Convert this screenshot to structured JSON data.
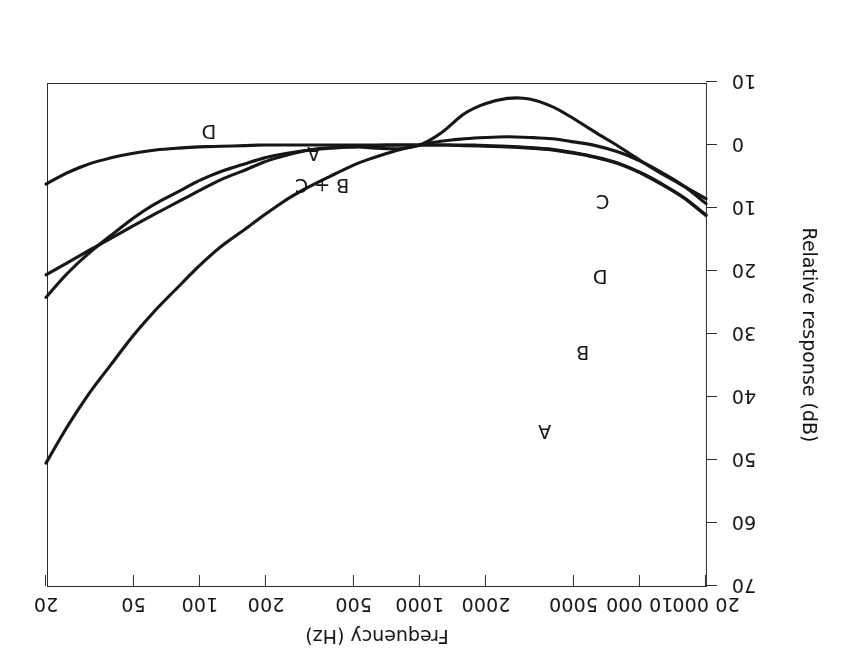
{
  "figure": {
    "orientation": "rotated-180",
    "background": "#ffffff",
    "ink_color": "#161616"
  },
  "chart_data": {
    "type": "line",
    "title": "",
    "xlabel": "Frequency (Hz)",
    "ylabel": "Relative response (dB)",
    "xscale": "log",
    "xlim": [
      20,
      20000
    ],
    "ylim": [
      -10,
      70
    ],
    "grid": false,
    "legend": "inline-curve-labels",
    "xticks": [
      20,
      50,
      100,
      200,
      500,
      1000,
      2000,
      5000,
      10000,
      20000
    ],
    "xtick_labels": [
      "20",
      "50",
      "100",
      "200",
      "500",
      "1000",
      "2000",
      "5000",
      "10 000",
      "20 000"
    ],
    "yticks": [
      70,
      60,
      50,
      40,
      30,
      20,
      10,
      0,
      -10
    ],
    "ytick_labels": [
      "70",
      "60",
      "50",
      "40",
      "30",
      "20",
      "10",
      "0",
      "10"
    ],
    "series": [
      {
        "name": "A",
        "label": "A",
        "points": [
          [
            20,
            50.5
          ],
          [
            25,
            44.7
          ],
          [
            31.5,
            39.4
          ],
          [
            40,
            34.6
          ],
          [
            50,
            30.2
          ],
          [
            63,
            26.2
          ],
          [
            80,
            22.5
          ],
          [
            100,
            19.1
          ],
          [
            125,
            16.1
          ],
          [
            160,
            13.4
          ],
          [
            200,
            10.9
          ],
          [
            250,
            8.6
          ],
          [
            315,
            6.6
          ],
          [
            400,
            4.8
          ],
          [
            500,
            3.2
          ],
          [
            630,
            1.9
          ],
          [
            800,
            0.8
          ],
          [
            1000,
            0.0
          ],
          [
            1250,
            -0.6
          ],
          [
            1600,
            -1.0
          ],
          [
            2000,
            -1.2
          ],
          [
            2500,
            -1.3
          ],
          [
            3150,
            -1.2
          ],
          [
            4000,
            -1.0
          ],
          [
            5000,
            -0.5
          ],
          [
            6300,
            0.1
          ],
          [
            8000,
            1.1
          ],
          [
            10000,
            2.5
          ],
          [
            12500,
            4.3
          ],
          [
            16000,
            6.6
          ],
          [
            20000,
            9.3
          ]
        ]
      },
      {
        "name": "B",
        "label": "B",
        "points": [
          [
            20,
            24.2
          ],
          [
            25,
            20.4
          ],
          [
            31.5,
            17.1
          ],
          [
            40,
            14.2
          ],
          [
            50,
            11.6
          ],
          [
            63,
            9.3
          ],
          [
            80,
            7.4
          ],
          [
            100,
            5.6
          ],
          [
            125,
            4.2
          ],
          [
            160,
            3.0
          ],
          [
            200,
            2.0
          ],
          [
            250,
            1.3
          ],
          [
            315,
            0.8
          ],
          [
            400,
            0.5
          ],
          [
            500,
            0.3
          ],
          [
            630,
            0.1
          ],
          [
            800,
            0.0
          ],
          [
            1000,
            0.0
          ],
          [
            1250,
            0.0
          ],
          [
            1600,
            0.0
          ],
          [
            2000,
            0.1
          ],
          [
            2500,
            0.2
          ],
          [
            3150,
            0.4
          ],
          [
            4000,
            0.7
          ],
          [
            5000,
            1.2
          ],
          [
            6300,
            1.9
          ],
          [
            8000,
            2.9
          ],
          [
            10000,
            4.3
          ],
          [
            12500,
            6.1
          ],
          [
            16000,
            8.4
          ],
          [
            20000,
            11.1
          ]
        ]
      },
      {
        "name": "C",
        "label": "C",
        "points": [
          [
            20,
            6.2
          ],
          [
            25,
            4.4
          ],
          [
            31.5,
            3.0
          ],
          [
            40,
            2.0
          ],
          [
            50,
            1.3
          ],
          [
            63,
            0.8
          ],
          [
            80,
            0.5
          ],
          [
            100,
            0.3
          ],
          [
            125,
            0.2
          ],
          [
            160,
            0.1
          ],
          [
            200,
            0.0
          ],
          [
            250,
            0.0
          ],
          [
            315,
            0.0
          ],
          [
            400,
            0.0
          ],
          [
            500,
            0.0
          ],
          [
            630,
            0.0
          ],
          [
            800,
            0.0
          ],
          [
            1000,
            0.0
          ],
          [
            1250,
            0.0
          ],
          [
            1600,
            0.1
          ],
          [
            2000,
            0.2
          ],
          [
            2500,
            0.3
          ],
          [
            3150,
            0.5
          ],
          [
            4000,
            0.8
          ],
          [
            5000,
            1.3
          ],
          [
            6300,
            2.0
          ],
          [
            8000,
            3.0
          ],
          [
            10000,
            4.4
          ],
          [
            12500,
            6.2
          ],
          [
            16000,
            8.5
          ],
          [
            20000,
            11.2
          ]
        ]
      },
      {
        "name": "D",
        "label": "D",
        "points": [
          [
            20,
            20.6
          ],
          [
            25,
            18.7
          ],
          [
            31.5,
            16.7
          ],
          [
            40,
            14.7
          ],
          [
            50,
            12.8
          ],
          [
            63,
            10.9
          ],
          [
            80,
            9.0
          ],
          [
            100,
            7.2
          ],
          [
            125,
            5.5
          ],
          [
            160,
            4.0
          ],
          [
            200,
            2.6
          ],
          [
            250,
            1.6
          ],
          [
            315,
            0.8
          ],
          [
            400,
            0.4
          ],
          [
            500,
            0.3
          ],
          [
            630,
            0.5
          ],
          [
            800,
            0.6
          ],
          [
            1000,
            0.0
          ],
          [
            1250,
            -1.9
          ],
          [
            1600,
            -5.0
          ],
          [
            2000,
            -6.6
          ],
          [
            2500,
            -7.4
          ],
          [
            3150,
            -7.3
          ],
          [
            4000,
            -6.1
          ],
          [
            5000,
            -4.2
          ],
          [
            6300,
            -2.0
          ],
          [
            8000,
            0.2
          ],
          [
            10000,
            2.4
          ],
          [
            12500,
            4.5
          ],
          [
            16000,
            6.6
          ],
          [
            20000,
            8.5
          ]
        ]
      }
    ],
    "annotations": [
      {
        "text": "A",
        "x": 3700,
        "y": 45.5
      },
      {
        "text": "B",
        "x": 5500,
        "y": 33.0
      },
      {
        "text": "D",
        "x": 6600,
        "y": 21.0
      },
      {
        "text": "C",
        "x": 6800,
        "y": 9.0
      },
      {
        "text": "B + C",
        "x": 360,
        "y": 6.5
      },
      {
        "text": "A",
        "x": 330,
        "y": 1.4
      },
      {
        "text": "D",
        "x": 110,
        "y": -2.0
      }
    ]
  }
}
